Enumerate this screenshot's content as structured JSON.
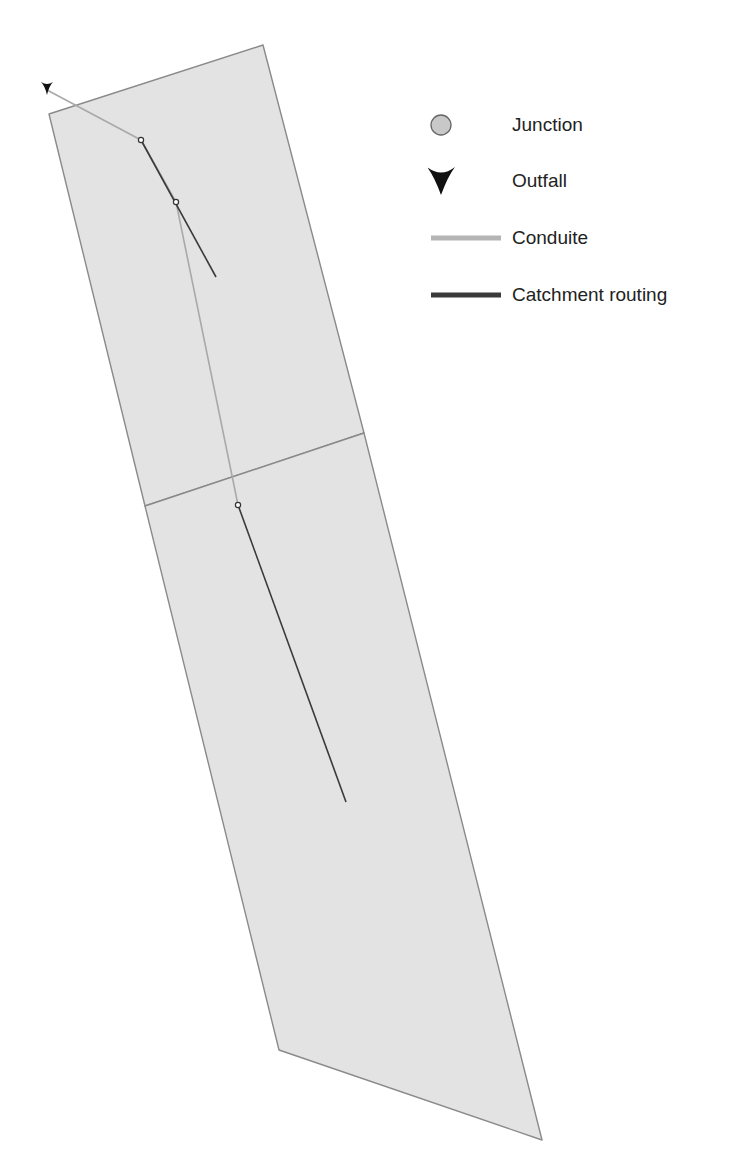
{
  "map": {
    "background_color": "#ffffff",
    "subcatchment_fill": "#e3e3e3",
    "subcatchment_stroke": "#8a8a8a",
    "subcatchments": [
      {
        "name": "upper-subcatchment",
        "points": [
          [
            49,
            114
          ],
          [
            263,
            45
          ],
          [
            364,
            433
          ],
          [
            145,
            506
          ]
        ]
      },
      {
        "name": "lower-subcatchment",
        "points": [
          [
            145,
            506
          ],
          [
            364,
            433
          ],
          [
            542,
            1140
          ],
          [
            279,
            1050
          ]
        ]
      }
    ],
    "conduit_color": "#a9a9a9",
    "conduits": [
      {
        "name": "conduit-outfall",
        "points": [
          [
            47,
            90
          ],
          [
            141,
            140
          ]
        ]
      },
      {
        "name": "conduit-1",
        "points": [
          [
            141,
            140
          ],
          [
            176,
            202
          ]
        ]
      },
      {
        "name": "conduit-2",
        "points": [
          [
            176,
            202
          ],
          [
            238,
            505
          ]
        ]
      }
    ],
    "routing_color": "#3a3a3a",
    "catchment_routing": [
      {
        "name": "routing-upper",
        "points": [
          [
            141,
            140
          ],
          [
            216,
            277
          ]
        ]
      },
      {
        "name": "routing-lower",
        "points": [
          [
            238,
            505
          ],
          [
            346,
            802
          ]
        ]
      }
    ],
    "junction_color": "#ffffff",
    "junction_stroke": "#333333",
    "junctions": [
      {
        "name": "junction-1",
        "x": 141,
        "y": 140
      },
      {
        "name": "junction-2",
        "x": 176,
        "y": 202
      },
      {
        "name": "junction-3",
        "x": 238,
        "y": 505
      }
    ],
    "outfall_color": "#111111",
    "outfall": {
      "name": "outfall-1",
      "x": 47,
      "y": 90
    }
  },
  "legend": {
    "items": [
      {
        "symbol": "junction-circle-icon",
        "label": "Junction",
        "color": "#c8c8c8"
      },
      {
        "symbol": "outfall-arrow-icon",
        "label": "Outfall",
        "color": "#111111"
      },
      {
        "symbol": "conduit-line-icon",
        "label": "Conduite",
        "color": "#b4b4b4"
      },
      {
        "symbol": "routing-line-icon",
        "label": "Catchment routing",
        "color": "#3a3a3a"
      }
    ]
  }
}
